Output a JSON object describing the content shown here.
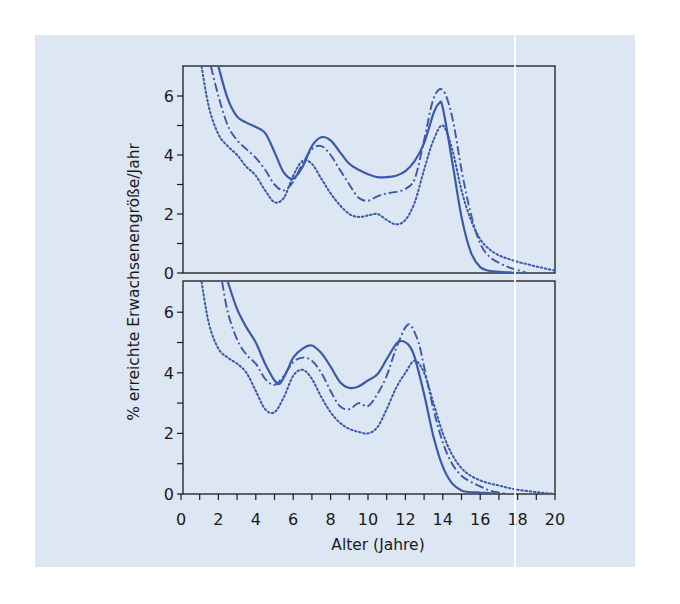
{
  "figure": {
    "background_color": "#dde6f3",
    "line_color": "#3a5aa8",
    "axis_color": "#1a1a1a"
  },
  "chart_data": [
    {
      "type": "line",
      "panel": "top",
      "title": "",
      "xlabel": "Alter (Jahre)",
      "ylabel": "% erreichte Erwachsenengröße/Jahr",
      "xlim": [
        0,
        20
      ],
      "ylim": [
        0,
        7
      ],
      "x_ticks": [
        0,
        2,
        4,
        6,
        8,
        10,
        12,
        14,
        16,
        18,
        20
      ],
      "y_ticks": [
        0,
        2,
        4,
        6
      ],
      "grid": false,
      "legend": "none",
      "series": [
        {
          "name": "solid",
          "style": "solid",
          "x": [
            2.0,
            2.5,
            3.0,
            3.5,
            4.0,
            4.5,
            5.0,
            5.5,
            6.0,
            6.5,
            7.0,
            7.5,
            8.0,
            8.5,
            9.0,
            9.5,
            10.0,
            10.5,
            11.0,
            11.5,
            12.0,
            12.5,
            13.0,
            13.5,
            13.8,
            14.0,
            14.5,
            15.0,
            15.5,
            16.0,
            16.5,
            17.0,
            17.5,
            18.0
          ],
          "values": [
            7.0,
            5.9,
            5.3,
            5.1,
            4.95,
            4.75,
            4.1,
            3.4,
            3.2,
            3.6,
            4.3,
            4.6,
            4.5,
            4.1,
            3.7,
            3.5,
            3.35,
            3.25,
            3.25,
            3.3,
            3.45,
            3.8,
            4.4,
            5.4,
            5.75,
            5.6,
            3.8,
            1.9,
            0.7,
            0.2,
            0.07,
            0.04,
            0.02,
            0.0
          ]
        },
        {
          "name": "dash-dot",
          "style": "dashdot",
          "x": [
            1.6,
            2.0,
            2.5,
            3.0,
            3.5,
            4.0,
            4.5,
            5.0,
            5.5,
            6.0,
            6.5,
            7.0,
            7.5,
            8.0,
            8.5,
            9.0,
            9.5,
            10.0,
            10.5,
            11.0,
            11.5,
            12.0,
            12.5,
            13.0,
            13.5,
            14.0,
            14.5,
            15.0,
            15.5,
            16.0,
            16.5,
            17.0,
            17.5,
            18.0,
            18.5
          ],
          "values": [
            7.0,
            6.0,
            5.0,
            4.5,
            4.2,
            3.9,
            3.5,
            3.0,
            2.8,
            3.1,
            3.7,
            4.2,
            4.3,
            4.0,
            3.5,
            3.0,
            2.55,
            2.45,
            2.6,
            2.7,
            2.75,
            2.85,
            3.2,
            4.5,
            5.9,
            6.2,
            5.3,
            3.5,
            2.0,
            1.0,
            0.55,
            0.35,
            0.2,
            0.1,
            0.0
          ]
        },
        {
          "name": "dotted",
          "style": "dotted",
          "x": [
            1.1,
            1.5,
            2.0,
            2.5,
            3.0,
            3.5,
            4.0,
            4.5,
            5.0,
            5.5,
            6.0,
            6.5,
            7.0,
            7.5,
            8.0,
            8.5,
            9.0,
            9.5,
            10.0,
            10.5,
            11.0,
            11.5,
            12.0,
            12.5,
            13.0,
            13.5,
            14.0,
            14.5,
            15.0,
            15.5,
            16.0,
            16.5,
            17.0,
            17.5,
            18.0,
            18.5,
            19.0,
            19.5,
            20.0
          ],
          "values": [
            7.0,
            5.6,
            4.7,
            4.3,
            4.0,
            3.6,
            3.3,
            2.8,
            2.4,
            2.55,
            3.3,
            3.8,
            3.7,
            3.2,
            2.7,
            2.3,
            2.0,
            1.9,
            1.95,
            2.0,
            1.8,
            1.65,
            1.8,
            2.4,
            3.5,
            4.5,
            5.0,
            4.2,
            2.8,
            1.8,
            1.15,
            0.8,
            0.6,
            0.48,
            0.38,
            0.3,
            0.22,
            0.15,
            0.08
          ]
        }
      ]
    },
    {
      "type": "line",
      "panel": "bottom",
      "title": "",
      "xlabel": "Alter (Jahre)",
      "ylabel": "% erreichte Erwachsenengröße/Jahr",
      "xlim": [
        0,
        20
      ],
      "ylim": [
        0,
        7
      ],
      "x_ticks": [
        0,
        2,
        4,
        6,
        8,
        10,
        12,
        14,
        16,
        18,
        20
      ],
      "y_ticks": [
        0,
        2,
        4,
        6
      ],
      "grid": false,
      "legend": "none",
      "series": [
        {
          "name": "solid",
          "style": "solid",
          "x": [
            2.5,
            3.0,
            3.5,
            4.0,
            4.5,
            5.0,
            5.3,
            5.7,
            6.0,
            6.5,
            7.0,
            7.5,
            8.0,
            8.5,
            9.0,
            9.5,
            10.0,
            10.5,
            11.0,
            11.5,
            11.8,
            12.2,
            12.5,
            13.0,
            13.5,
            14.0,
            14.5,
            15.0,
            15.5,
            16.0,
            16.5,
            17.0
          ],
          "values": [
            7.0,
            6.1,
            5.5,
            5.0,
            4.3,
            3.75,
            3.65,
            4.1,
            4.5,
            4.8,
            4.9,
            4.65,
            4.2,
            3.7,
            3.5,
            3.55,
            3.75,
            3.95,
            4.45,
            4.95,
            5.05,
            4.9,
            4.5,
            3.3,
            1.9,
            0.9,
            0.35,
            0.12,
            0.06,
            0.05,
            0.03,
            0.0
          ]
        },
        {
          "name": "dash-dot",
          "style": "dashdot",
          "x": [
            2.2,
            2.5,
            3.0,
            3.5,
            4.0,
            4.5,
            5.0,
            5.5,
            6.0,
            6.5,
            7.0,
            7.5,
            8.0,
            8.5,
            9.0,
            9.5,
            10.0,
            10.5,
            11.0,
            11.5,
            12.0,
            12.3,
            12.7,
            13.0,
            13.5,
            14.0,
            14.5,
            15.0,
            15.5,
            16.0,
            16.5,
            17.0,
            17.5
          ],
          "values": [
            7.0,
            6.0,
            5.1,
            4.6,
            4.3,
            3.8,
            3.6,
            3.9,
            4.35,
            4.5,
            4.4,
            4.0,
            3.4,
            2.9,
            2.8,
            3.0,
            2.9,
            3.3,
            3.9,
            4.8,
            5.5,
            5.55,
            5.0,
            4.2,
            2.8,
            1.7,
            1.0,
            0.6,
            0.4,
            0.25,
            0.12,
            0.05,
            0.0
          ]
        },
        {
          "name": "dotted",
          "style": "dotted",
          "x": [
            1.1,
            1.5,
            2.0,
            2.5,
            3.0,
            3.5,
            4.0,
            4.5,
            5.0,
            5.5,
            6.0,
            6.5,
            7.0,
            7.5,
            8.0,
            8.5,
            9.0,
            9.5,
            10.0,
            10.5,
            11.0,
            11.5,
            12.0,
            12.5,
            13.0,
            13.5,
            14.0,
            14.5,
            15.0,
            15.5,
            16.0,
            16.5,
            17.0,
            17.5,
            18.0,
            18.5,
            19.0,
            19.5,
            20.0
          ],
          "values": [
            7.0,
            5.6,
            4.8,
            4.5,
            4.3,
            4.0,
            3.4,
            2.8,
            2.7,
            3.2,
            3.9,
            4.1,
            3.8,
            3.2,
            2.7,
            2.35,
            2.15,
            2.05,
            2.0,
            2.2,
            2.8,
            3.5,
            4.0,
            4.4,
            4.0,
            3.0,
            2.0,
            1.3,
            0.85,
            0.6,
            0.45,
            0.35,
            0.28,
            0.2,
            0.14,
            0.1,
            0.06,
            0.03,
            0.0
          ]
        }
      ]
    }
  ]
}
